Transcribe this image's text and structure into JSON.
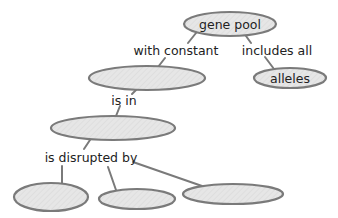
{
  "diagram": {
    "type": "concept-map",
    "colors": {
      "node_fill": "#e6e6e6",
      "node_stroke": "#7a7a7a",
      "edge": "#7a7a7a",
      "text": "#222222",
      "background": "#ffffff"
    },
    "nodes": [
      {
        "id": "gene_pool",
        "label": "gene pool",
        "cx": 230,
        "cy": 24,
        "rx": 46,
        "ry": 12
      },
      {
        "id": "blank_1",
        "label": "",
        "cx": 147,
        "cy": 78,
        "rx": 58,
        "ry": 12
      },
      {
        "id": "alleles",
        "label": "alleles",
        "cx": 290,
        "cy": 78,
        "rx": 36,
        "ry": 10
      },
      {
        "id": "blank_2",
        "label": "",
        "cx": 113,
        "cy": 128,
        "rx": 62,
        "ry": 12
      },
      {
        "id": "blank_3",
        "label": "",
        "cx": 51,
        "cy": 197,
        "rx": 37,
        "ry": 14
      },
      {
        "id": "blank_4",
        "label": "",
        "cx": 137,
        "cy": 199,
        "rx": 38,
        "ry": 10
      },
      {
        "id": "blank_5",
        "label": "",
        "cx": 233,
        "cy": 194,
        "rx": 50,
        "ry": 10
      }
    ],
    "links": [
      {
        "id": "with_constant",
        "label": "with constant",
        "x": 176,
        "y": 50,
        "from": "gene_pool",
        "to": "blank_1"
      },
      {
        "id": "includes_all",
        "label": "includes all",
        "x": 277,
        "y": 50,
        "from": "gene_pool",
        "to": "alleles"
      },
      {
        "id": "is_in",
        "label": "is in",
        "x": 124,
        "y": 99,
        "from": "blank_1",
        "to": "blank_2"
      },
      {
        "id": "is_disrupted_by",
        "label": "is disrupted by",
        "x": 91,
        "y": 157,
        "from": "blank_2",
        "to": [
          "blank_3",
          "blank_4",
          "blank_5"
        ]
      }
    ]
  }
}
